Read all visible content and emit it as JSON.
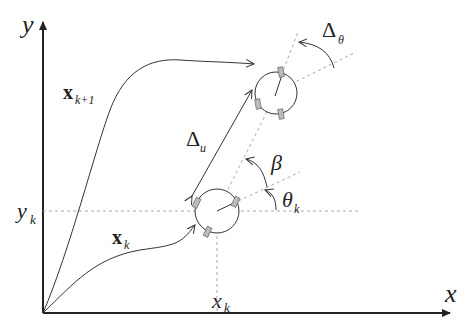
{
  "diagram": {
    "top_caption": "",
    "axes": {
      "x_label": "x",
      "y_label": "y",
      "xk_label": "x",
      "xk_sub": "k",
      "yk_label": "y",
      "yk_sub": "k"
    },
    "paths": {
      "xk_label": "x",
      "xk_sub": "k",
      "xk1_label": "x",
      "xk1_sub": "k+1"
    },
    "annotations": {
      "delta_u": "Δ",
      "delta_u_sub": "u",
      "delta_theta": "Δ",
      "delta_theta_sub": "θ",
      "beta": "β",
      "theta_k": "θ",
      "theta_k_sub": "k"
    },
    "colors": {
      "line": "#333333",
      "dashed": "#aaaaaa",
      "wheel": "#bbbbbb"
    }
  }
}
